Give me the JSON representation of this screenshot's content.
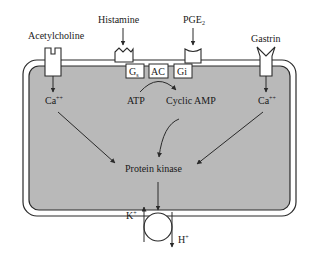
{
  "diagram": {
    "type": "cell-signaling",
    "colors": {
      "cytoplasm": "#b9b9b9",
      "membrane": "#ffffff",
      "stroke": "#2a2a2a",
      "background": "#ffffff"
    },
    "labels": {
      "acetylcholine": "Acetylcholine",
      "histamine": "Histamine",
      "pge2": "PGE",
      "pge2_sub": "2",
      "gastrin": "Gastrin",
      "gs": "G",
      "gs_sub": "s",
      "ac": "AC",
      "gi": "Gi",
      "atp": "ATP",
      "cyclic_amp": "Cyclic AMP",
      "ca_left": "Ca",
      "ca_left_sup": "++",
      "ca_right": "Ca",
      "ca_right_sup": "++",
      "protein_kinase": "Protein kinase",
      "k_plus": "K",
      "k_plus_sup": "+",
      "h_plus": "H",
      "h_plus_sup": "+"
    }
  }
}
